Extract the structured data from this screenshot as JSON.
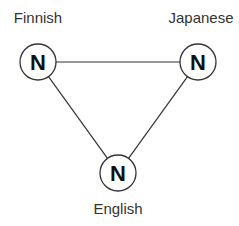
{
  "colors": {
    "background": "#ffffff",
    "stroke": "#333333",
    "text": "#333333",
    "node_fill": "#ffffff"
  },
  "nodes": [
    {
      "id": "finnish",
      "letter": "N",
      "label": "Finnish",
      "cx": 38,
      "cy": 62,
      "r": 18,
      "label_x": 38,
      "label_y": 23
    },
    {
      "id": "japanese",
      "letter": "N",
      "label": "Japanese",
      "cx": 198,
      "cy": 62,
      "r": 18,
      "label_x": 201,
      "label_y": 23
    },
    {
      "id": "english",
      "letter": "N",
      "label": "English",
      "cx": 118,
      "cy": 173,
      "r": 18,
      "label_x": 118,
      "label_y": 214
    }
  ],
  "edges": [
    {
      "from": "finnish",
      "to": "japanese"
    },
    {
      "from": "finnish",
      "to": "english"
    },
    {
      "from": "japanese",
      "to": "english"
    }
  ]
}
